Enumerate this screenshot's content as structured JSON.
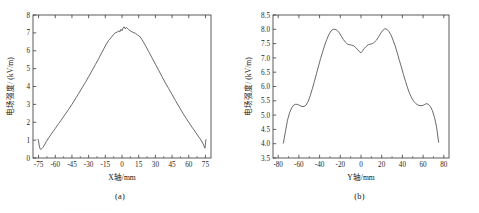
{
  "figure": {
    "background_color": "#ffffff",
    "curve_color": "#4f4f4f",
    "axis_color": "#3a3a3a",
    "bottom_partial_text": "· · · · · · · · · · · · · · · · · ·"
  },
  "panels": [
    {
      "id": "a",
      "caption": "(a)",
      "xlabel": "X轴/mm",
      "ylabel": "电场强度/ (kV/m)"
    },
    {
      "id": "b",
      "caption": "(b)",
      "xlabel": "Y轴/mm",
      "ylabel": "电场强度/ (kV/m)"
    }
  ],
  "chart_data": [
    {
      "type": "line",
      "panel": "a",
      "title": "(a)",
      "xlabel": "X轴/mm",
      "ylabel": "电场强度/ (kV/m)",
      "xlim": [
        -80,
        80
      ],
      "ylim": [
        0,
        8
      ],
      "xticks": [
        -75,
        -60,
        -45,
        -30,
        -15,
        0,
        15,
        30,
        45,
        60,
        75
      ],
      "xticklabels": [
        "-75",
        "-60",
        "-45",
        "-30",
        "-15",
        "0",
        "15",
        "30",
        "45",
        "60",
        "75"
      ],
      "yticks": [
        0,
        1,
        2,
        3,
        4,
        5,
        6,
        7,
        8
      ],
      "yticklabels": [
        "0",
        "1",
        "2",
        "3",
        "4",
        "5",
        "6",
        "7",
        "8"
      ],
      "grid": false,
      "legend": "none",
      "series": [
        {
          "name": "电场强度",
          "x": [
            -75.5,
            -75.0,
            -74.5,
            -74.0,
            -73.5,
            -73.0,
            -72.5,
            -72.0,
            -71.0,
            -70.0,
            -68.0,
            -66.0,
            -64.0,
            -62.0,
            -60.0,
            -57.0,
            -54.0,
            -51.0,
            -48.0,
            -45.0,
            -42.0,
            -39.0,
            -36.0,
            -33.0,
            -30.0,
            -27.0,
            -24.0,
            -21.0,
            -18.0,
            -16.0,
            -14.0,
            -12.0,
            -10.0,
            -8.0,
            -6.0,
            -4.0,
            -3.0,
            -2.0,
            -1.0,
            0.0,
            1.0,
            2.0,
            3.0,
            4.0,
            5.0,
            6.0,
            8.0,
            10.0,
            12.0,
            14.0,
            16.0,
            18.0,
            21.0,
            24.0,
            27.0,
            30.0,
            33.0,
            36.0,
            39.0,
            42.0,
            45.0,
            48.0,
            51.0,
            54.0,
            57.0,
            60.0,
            63.0,
            66.0,
            69.0,
            71.0,
            73.0,
            74.0,
            74.6,
            75.0,
            75.4
          ],
          "y": [
            1.05,
            0.95,
            0.72,
            0.58,
            0.5,
            0.48,
            0.5,
            0.53,
            0.6,
            0.7,
            0.92,
            1.12,
            1.3,
            1.48,
            1.65,
            1.92,
            2.18,
            2.45,
            2.72,
            3.0,
            3.3,
            3.6,
            3.92,
            4.22,
            4.55,
            4.88,
            5.22,
            5.55,
            5.92,
            6.15,
            6.38,
            6.58,
            6.72,
            6.88,
            7.0,
            7.05,
            7.12,
            7.05,
            7.2,
            7.12,
            7.28,
            7.34,
            7.22,
            7.3,
            7.24,
            7.18,
            7.1,
            7.02,
            6.98,
            6.88,
            6.8,
            6.62,
            6.3,
            5.95,
            5.6,
            5.25,
            4.9,
            4.55,
            4.2,
            3.88,
            3.55,
            3.22,
            2.9,
            2.58,
            2.28,
            2.0,
            1.72,
            1.45,
            1.18,
            1.0,
            0.78,
            0.62,
            0.55,
            0.78,
            1.02
          ]
        }
      ]
    },
    {
      "type": "line",
      "panel": "b",
      "title": "(b)",
      "xlabel": "Y轴/mm",
      "ylabel": "电场强度/ (kV/m)",
      "xlim": [
        -85,
        85
      ],
      "ylim": [
        3.5,
        8.5
      ],
      "xticks": [
        -80,
        -60,
        -40,
        -20,
        0,
        20,
        40,
        60,
        80
      ],
      "xticklabels": [
        "-80",
        "-60",
        "-40",
        "-20",
        "0",
        "20",
        "40",
        "60",
        "80"
      ],
      "yticks": [
        3.5,
        4.0,
        4.5,
        5.0,
        5.5,
        6.0,
        6.5,
        7.0,
        7.5,
        8.0,
        8.5
      ],
      "yticklabels": [
        "3.5",
        "4.0",
        "4.5",
        "5.0",
        "5.5",
        "6.0",
        "6.5",
        "7.0",
        "7.5",
        "8.0",
        "8.5"
      ],
      "grid": false,
      "legend": "none",
      "series": [
        {
          "name": "电场强度",
          "x": [
            -75.0,
            -73.0,
            -71.0,
            -69.0,
            -67.0,
            -65.0,
            -63.0,
            -61.0,
            -59.0,
            -57.0,
            -55.0,
            -53.0,
            -51.0,
            -49.0,
            -47.0,
            -45.0,
            -43.0,
            -41.0,
            -39.0,
            -37.0,
            -35.0,
            -33.0,
            -31.0,
            -29.0,
            -27.0,
            -25.0,
            -23.0,
            -21.0,
            -19.0,
            -17.0,
            -15.0,
            -13.0,
            -11.0,
            -9.0,
            -7.0,
            -5.0,
            -3.0,
            -1.0,
            0.0,
            1.0,
            3.0,
            5.0,
            7.0,
            9.0,
            11.0,
            13.0,
            15.0,
            17.0,
            19.0,
            21.0,
            23.0,
            25.0,
            27.0,
            29.0,
            31.0,
            33.0,
            35.0,
            37.0,
            39.0,
            41.0,
            43.0,
            45.0,
            47.0,
            49.0,
            51.0,
            53.0,
            55.0,
            57.0,
            59.0,
            61.0,
            63.0,
            65.0,
            67.0,
            69.0,
            71.0,
            73.0,
            75.0
          ],
          "y": [
            4.02,
            4.42,
            4.82,
            5.08,
            5.25,
            5.35,
            5.38,
            5.37,
            5.33,
            5.3,
            5.3,
            5.35,
            5.48,
            5.68,
            5.92,
            6.18,
            6.45,
            6.72,
            6.98,
            7.22,
            7.45,
            7.65,
            7.82,
            7.94,
            8.0,
            8.0,
            7.96,
            7.88,
            7.76,
            7.64,
            7.55,
            7.48,
            7.46,
            7.45,
            7.42,
            7.36,
            7.28,
            7.2,
            7.18,
            7.22,
            7.32,
            7.4,
            7.46,
            7.48,
            7.5,
            7.55,
            7.62,
            7.74,
            7.86,
            7.96,
            8.02,
            8.0,
            7.92,
            7.8,
            7.62,
            7.42,
            7.18,
            6.92,
            6.68,
            6.42,
            6.18,
            5.95,
            5.75,
            5.6,
            5.48,
            5.4,
            5.35,
            5.33,
            5.33,
            5.36,
            5.4,
            5.38,
            5.3,
            5.15,
            4.92,
            4.58,
            4.05
          ]
        }
      ]
    }
  ]
}
